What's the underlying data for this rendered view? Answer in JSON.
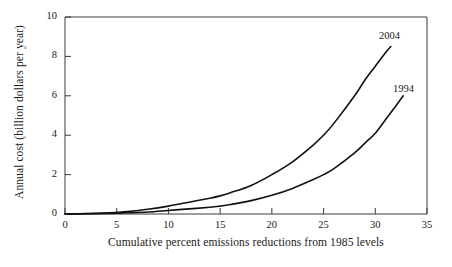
{
  "chart_data": {
    "type": "line",
    "title": "",
    "xlabel": "Cumulative percent emissions reductions from 1985 levels",
    "ylabel": "Annual cost (billion dollars per year)",
    "xlim": [
      0,
      35
    ],
    "ylim": [
      0,
      10
    ],
    "xticks": [
      0,
      5,
      10,
      15,
      20,
      25,
      30,
      35
    ],
    "yticks": [
      0,
      2,
      4,
      6,
      8,
      10
    ],
    "xtick_labels": [
      "0",
      "5",
      "10",
      "15",
      "20",
      "25",
      "30",
      "35"
    ],
    "ytick_labels": [
      "0",
      "2",
      "4",
      "6",
      "8",
      "10"
    ],
    "grid": false,
    "legend": "inline-curve-labels",
    "line_color": "#111111",
    "background": "#ffffff",
    "series": [
      {
        "name": "2004",
        "label": "2004",
        "x": [
          0,
          2,
          4,
          5,
          6,
          8,
          10,
          12,
          14,
          15,
          16,
          18,
          20,
          22,
          24,
          25,
          26,
          28,
          29,
          30,
          31,
          31.5
        ],
        "values": [
          0.0,
          0.02,
          0.05,
          0.08,
          0.12,
          0.24,
          0.4,
          0.6,
          0.8,
          0.92,
          1.08,
          1.45,
          2.0,
          2.65,
          3.5,
          4.0,
          4.6,
          6.0,
          6.8,
          7.5,
          8.2,
          8.5
        ]
      },
      {
        "name": "1994",
        "label": "1994",
        "x": [
          0,
          2,
          4,
          5,
          6,
          8,
          10,
          12,
          14,
          15,
          16,
          18,
          20,
          22,
          24,
          25,
          26,
          28,
          29,
          30,
          31,
          32,
          32.7
        ],
        "values": [
          0.0,
          0.01,
          0.03,
          0.04,
          0.06,
          0.1,
          0.18,
          0.26,
          0.34,
          0.4,
          0.48,
          0.68,
          0.95,
          1.3,
          1.75,
          2.0,
          2.3,
          3.1,
          3.6,
          4.1,
          4.8,
          5.5,
          6.0
        ]
      }
    ]
  },
  "axis": {
    "ylabel": "Annual cost (billion dollars per year)",
    "xlabel": "Cumulative percent emissions reductions from 1985 levels"
  },
  "curve_labels": {
    "upper": "2004",
    "lower": "1994"
  }
}
